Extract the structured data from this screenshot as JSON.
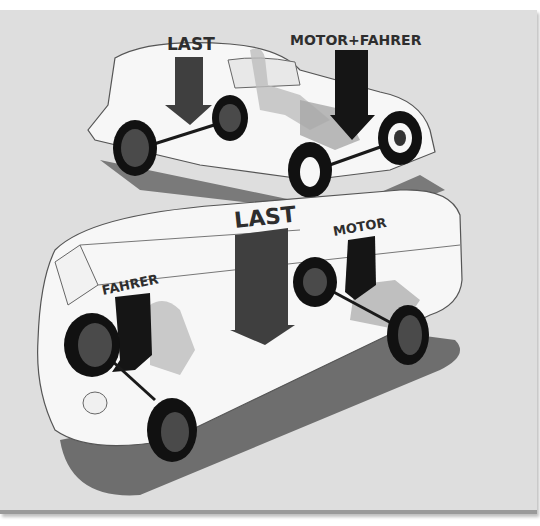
{
  "illustration": {
    "subject": "Weight distribution comparison: conventional car-based delivery van vs. forward-control van",
    "background_color": "#dedede",
    "top_vehicle": {
      "labels": [
        "LAST",
        "MOTOR+FAHRER"
      ]
    },
    "bottom_vehicle": {
      "labels": [
        "LAST",
        "MOTOR",
        "FAHRER"
      ]
    },
    "colors": {
      "body": "#f7f7f7",
      "arrow_last": "#3f3f3f",
      "arrow_dark": "#151515",
      "tire": "#111111",
      "hub": "#4a4a4a",
      "shadow": "#6e6e6e",
      "label": "#2e2e2e"
    }
  }
}
